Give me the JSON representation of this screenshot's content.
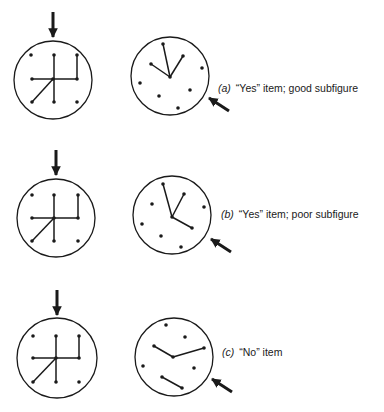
{
  "figure": {
    "stroke_color": "#1a1a1a",
    "background": "#ffffff",
    "rows": [
      {
        "id": "a",
        "tag": "(a)",
        "caption": "“Yes” item; good subfigure",
        "label_pos": [
          218,
          82
        ],
        "reference": {
          "center": [
            53,
            80
          ],
          "radius": 39,
          "arrow": {
            "from": [
              53,
              12
            ],
            "to": [
              53,
              37
            ]
          },
          "dots": [
            [
              31,
              55
            ],
            [
              54,
              55
            ],
            [
              77,
              55
            ],
            [
              32,
              79
            ],
            [
              53,
              79
            ],
            [
              77,
              79
            ],
            [
              32,
              102
            ],
            [
              54,
              102
            ],
            [
              77,
              102
            ]
          ],
          "segments": [
            [
              [
                54,
                55
              ],
              [
                54,
                102
              ]
            ],
            [
              [
                32,
                79
              ],
              [
                77,
                79
              ]
            ],
            [
              [
                77,
                55
              ],
              [
                77,
                79
              ]
            ],
            [
              [
                53,
                79
              ],
              [
                32,
                102
              ]
            ]
          ]
        },
        "test": {
          "center": [
            170,
            76
          ],
          "radius": 39,
          "arrow": {
            "from": [
              229,
              111
            ],
            "to": [
              209,
              98
            ]
          },
          "dots": [
            [
              163,
              44
            ],
            [
              151,
              64
            ],
            [
              183,
              56
            ],
            [
              170,
              77
            ],
            [
              202,
              68
            ],
            [
              140,
              83
            ],
            [
              190,
              90
            ],
            [
              159,
              96
            ],
            [
              178,
              108
            ]
          ],
          "segments": [
            [
              [
                170,
                77
              ],
              [
                163,
                44
              ]
            ],
            [
              [
                170,
                77
              ],
              [
                151,
                64
              ]
            ],
            [
              [
                170,
                77
              ],
              [
                183,
                56
              ]
            ]
          ]
        }
      },
      {
        "id": "b",
        "tag": "(b)",
        "caption": "“Yes” item; poor subfigure",
        "label_pos": [
          221,
          208
        ],
        "reference": {
          "center": [
            56,
            218
          ],
          "radius": 39,
          "arrow": {
            "from": [
              56,
              150
            ],
            "to": [
              56,
              175
            ]
          },
          "dots": [
            [
              32,
              195
            ],
            [
              54,
              195
            ],
            [
              78,
              195
            ],
            [
              32,
              218
            ],
            [
              54,
              218
            ],
            [
              78,
              218
            ],
            [
              32,
              241
            ],
            [
              54,
              241
            ],
            [
              78,
              241
            ]
          ],
          "segments": [
            [
              [
                54,
                195
              ],
              [
                54,
                241
              ]
            ],
            [
              [
                32,
                218
              ],
              [
                78,
                218
              ]
            ],
            [
              [
                78,
                195
              ],
              [
                78,
                218
              ]
            ],
            [
              [
                54,
                218
              ],
              [
                32,
                241
              ]
            ]
          ]
        },
        "test": {
          "center": [
            172,
            215
          ],
          "radius": 39,
          "arrow": {
            "from": [
              231,
              252
            ],
            "to": [
              211,
              239
            ]
          },
          "dots": [
            [
              163,
              184
            ],
            [
              184,
              194
            ],
            [
              152,
              204
            ],
            [
              204,
              207
            ],
            [
              172,
              217
            ],
            [
              142,
              224
            ],
            [
              192,
              228
            ],
            [
              161,
              236
            ],
            [
              181,
              247
            ]
          ],
          "segments": [
            [
              [
                172,
                217
              ],
              [
                163,
                184
              ]
            ],
            [
              [
                172,
                217
              ],
              [
                184,
                194
              ]
            ],
            [
              [
                172,
                217
              ],
              [
                192,
                228
              ]
            ]
          ]
        }
      },
      {
        "id": "c",
        "tag": "(c)",
        "caption": "“No” item",
        "label_pos": [
          222,
          346
        ],
        "reference": {
          "center": [
            57,
            358
          ],
          "radius": 40,
          "arrow": {
            "from": [
              57,
              290
            ],
            "to": [
              57,
              315
            ]
          },
          "dots": [
            [
              33,
              336
            ],
            [
              56,
              336
            ],
            [
              79,
              336
            ],
            [
              33,
              358
            ],
            [
              56,
              358
            ],
            [
              79,
              358
            ],
            [
              33,
              382
            ],
            [
              56,
              382
            ],
            [
              79,
              382
            ]
          ],
          "segments": [
            [
              [
                56,
                336
              ],
              [
                56,
                382
              ]
            ],
            [
              [
                33,
                358
              ],
              [
                79,
                358
              ]
            ],
            [
              [
                79,
                336
              ],
              [
                79,
                358
              ]
            ],
            [
              [
                56,
                358
              ],
              [
                33,
                382
              ]
            ]
          ]
        },
        "test": {
          "center": [
            174,
            357
          ],
          "radius": 39,
          "arrow": {
            "from": [
              232,
              392
            ],
            "to": [
              212,
              379
            ]
          },
          "dots": [
            [
              166,
              325
            ],
            [
              185,
              337
            ],
            [
              154,
              346
            ],
            [
              204,
              348
            ],
            [
              173,
              357
            ],
            [
              143,
              366
            ],
            [
              194,
              368
            ],
            [
              162,
              377
            ],
            [
              182,
              388
            ]
          ],
          "segments": [
            [
              [
                154,
                346
              ],
              [
                173,
                357
              ]
            ],
            [
              [
                173,
                357
              ],
              [
                204,
                348
              ]
            ],
            [
              [
                162,
                377
              ],
              [
                182,
                388
              ]
            ]
          ]
        }
      }
    ]
  }
}
